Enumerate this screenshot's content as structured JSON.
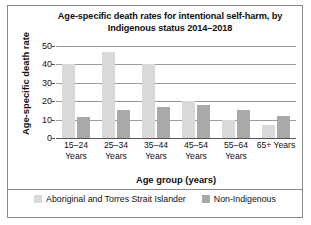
{
  "chart_data": {
    "type": "bar",
    "title": "Age-specific death rates for intentional self-harm, by Indigenous status 2014–2018",
    "xlabel": "Age group (years)",
    "ylabel": "Age-specific death rate",
    "ylim": [
      0,
      50
    ],
    "yticks": [
      50,
      40,
      30,
      20,
      10,
      0
    ],
    "ytick_labels": [
      "50",
      "40",
      "30",
      "20",
      "10",
      "0"
    ],
    "grid": true,
    "legend_position": "bottom",
    "categories": [
      "15–24 Years",
      "25–34 Years",
      "35–44 Years",
      "45–54 Years",
      "55–64 Years",
      "65+ Years"
    ],
    "series": [
      {
        "name": "Aboriginal and Torres Strait Islander",
        "color": "#d9d9d9",
        "values": [
          40,
          47,
          40,
          20,
          10,
          7
        ]
      },
      {
        "name": "Non-Indigenous",
        "color": "#a9a9a9",
        "values": [
          11.5,
          15,
          17,
          18,
          15,
          12
        ]
      }
    ]
  },
  "frame": {
    "border_color": "#8a8a8a"
  }
}
